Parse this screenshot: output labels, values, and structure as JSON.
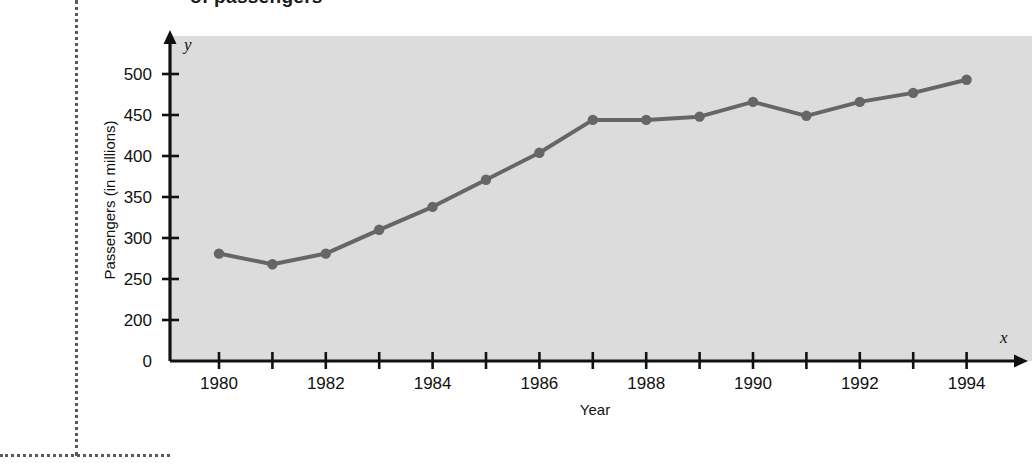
{
  "page": {
    "heading_sliver": "of passengers",
    "background_color": "#ffffff",
    "guide_color": "#5a5a5a"
  },
  "chart_data": {
    "type": "line",
    "title": "",
    "xlabel": "Year",
    "ylabel": "Passengers (in millions)",
    "x_axis_name": "x",
    "y_axis_name": "y",
    "plot_background_color": "#dcdcdc",
    "line_color": "#666666",
    "marker_color": "#666666",
    "axis_color": "#111111",
    "grid": false,
    "legend": false,
    "axis_break": true,
    "xlim": [
      1979.2,
      1994.8
    ],
    "ylim": [
      200,
      520
    ],
    "x_tick_values": [
      1980,
      1981,
      1982,
      1983,
      1984,
      1985,
      1986,
      1987,
      1988,
      1989,
      1990,
      1991,
      1992,
      1993,
      1994
    ],
    "x_tick_labels": [
      "1980",
      "",
      "1982",
      "",
      "1984",
      "",
      "1986",
      "",
      "1988",
      "",
      "1990",
      "",
      "1992",
      "",
      "1994"
    ],
    "y_tick_values": [
      0,
      200,
      250,
      300,
      350,
      400,
      450,
      500
    ],
    "y_tick_labels": [
      "0",
      "200",
      "250",
      "300",
      "350",
      "400",
      "450",
      "500"
    ],
    "x": [
      1980,
      1981,
      1982,
      1983,
      1984,
      1985,
      1986,
      1987,
      1988,
      1989,
      1990,
      1991,
      1992,
      1993,
      1994
    ],
    "values": [
      281,
      268,
      281,
      310,
      338,
      371,
      404,
      444,
      444,
      448,
      466,
      449,
      466,
      477,
      493
    ],
    "series": [
      {
        "name": "Passengers",
        "values": [
          281,
          268,
          281,
          310,
          338,
          371,
          404,
          444,
          444,
          448,
          466,
          449,
          466,
          477,
          493
        ]
      }
    ]
  }
}
